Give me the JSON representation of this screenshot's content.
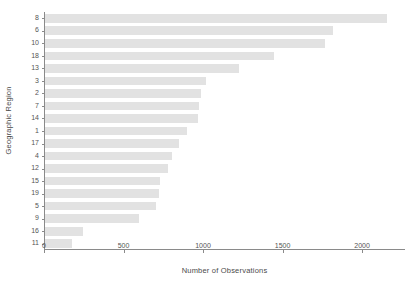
{
  "chart_data": {
    "type": "bar",
    "orientation": "horizontal",
    "title": "",
    "xlabel": "Number of Observations",
    "ylabel": "Geographic Region",
    "categories": [
      "8",
      "6",
      "10",
      "18",
      "13",
      "3",
      "2",
      "7",
      "14",
      "1",
      "17",
      "4",
      "12",
      "15",
      "19",
      "5",
      "9",
      "16",
      "11"
    ],
    "values": [
      2150,
      1810,
      1760,
      1440,
      1220,
      1010,
      980,
      970,
      965,
      895,
      840,
      800,
      775,
      720,
      715,
      700,
      590,
      240,
      170
    ],
    "xlim": [
      0,
      2270
    ],
    "xticks": [
      0,
      500,
      1000,
      1500,
      2000
    ],
    "xtick_labels": [
      "0",
      "500",
      "1000",
      "1500",
      "2000"
    ],
    "grid": false,
    "legend": null,
    "bar_color": "#e2e2e2",
    "axis_color": "#8a8a8a",
    "text_color": "#555555"
  }
}
